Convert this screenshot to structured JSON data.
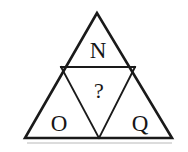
{
  "figure": {
    "name": "subdivided-triangle-puzzle",
    "type": "geometric-diagram",
    "background_color": "#ffffff",
    "stroke_color": "#1a1a1a",
    "text_color": "#161616",
    "shadow_color": "#b9b9b9",
    "outer_triangle": {
      "name": "outer-triangle",
      "apex": [
        97,
        13
      ],
      "left_corner": [
        25,
        138
      ],
      "right_corner": [
        172,
        138
      ],
      "points": "97,13 25,138 172,138"
    },
    "midpoints": {
      "left_edge": [
        61,
        67
      ],
      "right_edge": [
        135,
        67
      ],
      "base": [
        99,
        138
      ]
    },
    "inner_lines": [
      {
        "name": "horizontal-divider",
        "from": [
          61,
          67
        ],
        "to": [
          135,
          67
        ]
      },
      {
        "name": "left-diagonal",
        "from": [
          61,
          67
        ],
        "to": [
          99,
          138
        ]
      },
      {
        "name": "right-diagonal",
        "from": [
          135,
          67
        ],
        "to": [
          99,
          138
        ]
      }
    ],
    "base_shadow": {
      "from": [
        27,
        143
      ],
      "to": [
        172,
        143
      ]
    },
    "cells": [
      {
        "name": "top-cell",
        "position": "top",
        "label": "N",
        "label_x": 98,
        "label_y": 58,
        "font_size": 23
      },
      {
        "name": "center-cell",
        "position": "center-inverted",
        "label": "?",
        "label_x": 99,
        "label_y": 98,
        "font_size": 22
      },
      {
        "name": "bottom-left-cell",
        "position": "bottom-left",
        "label": "O",
        "label_x": 59,
        "label_y": 131,
        "font_size": 23
      },
      {
        "name": "bottom-right-cell",
        "position": "bottom-right",
        "label": "Q",
        "label_x": 140,
        "label_y": 131,
        "font_size": 23
      }
    ]
  }
}
